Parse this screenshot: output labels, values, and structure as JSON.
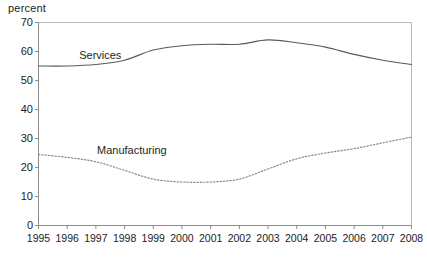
{
  "axis_unit_label": "percent",
  "series_labels": {
    "services": "Services",
    "manufacturing": "Manufacturing"
  },
  "chart_data": {
    "type": "line",
    "title": "",
    "subtitle": "",
    "xlabel": "",
    "ylabel": "percent",
    "grid": false,
    "legend_position": "inline-annotations",
    "x": [
      1995,
      1996,
      1997,
      1998,
      1999,
      2000,
      2001,
      2002,
      2003,
      2004,
      2005,
      2006,
      2007,
      2008
    ],
    "categories": [
      "1995",
      "1996",
      "1997",
      "1998",
      "1999",
      "2000",
      "2001",
      "2002",
      "2003",
      "2004",
      "2005",
      "2006",
      "2007",
      "2008"
    ],
    "xtick_labels": [
      "1995",
      "1996",
      "1997",
      "1998",
      "1999",
      "2000",
      "2001",
      "2002",
      "2003",
      "2004",
      "2005",
      "2006",
      "2007",
      "2008"
    ],
    "ytick_labels": [
      "0",
      "10",
      "20",
      "30",
      "40",
      "50",
      "60",
      "70"
    ],
    "yticks": [
      0,
      10,
      20,
      30,
      40,
      50,
      60,
      70
    ],
    "ylim": [
      0,
      70
    ],
    "xlim": [
      1995,
      2008
    ],
    "series": [
      {
        "name": "Services",
        "style": "solid",
        "color": "#5a5a5a",
        "values": [
          55.0,
          55.0,
          55.5,
          57.0,
          60.5,
          62.0,
          62.5,
          62.5,
          64.0,
          63.0,
          61.5,
          59.0,
          57.0,
          55.5
        ]
      },
      {
        "name": "Manufacturing",
        "style": "dotted",
        "color": "#8a8a8a",
        "values": [
          24.5,
          23.5,
          22.0,
          19.0,
          16.0,
          15.0,
          15.0,
          16.0,
          19.5,
          23.0,
          25.0,
          26.5,
          28.5,
          30.5
        ]
      }
    ]
  }
}
